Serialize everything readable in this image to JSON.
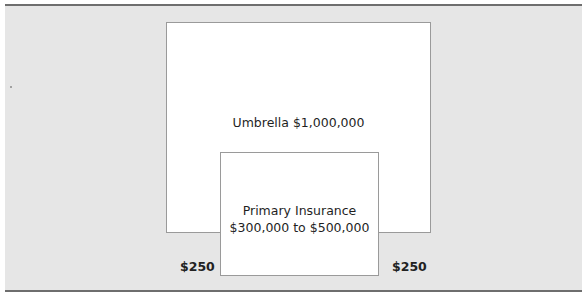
{
  "diagram": {
    "type": "nested-coverage-layers",
    "umbrella": {
      "label": "Umbrella $1,000,000"
    },
    "primary": {
      "line1": "Primary Insurance",
      "line2": "$300,000 to $500,000"
    },
    "deductibles": {
      "left": "$250",
      "right": "$250"
    },
    "colors": {
      "panel_background": "#e6e6e6",
      "box_fill": "#ffffff",
      "box_border": "#9a9a9a",
      "rule": "#6e6e6e"
    }
  }
}
